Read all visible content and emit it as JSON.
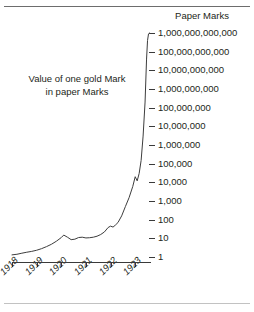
{
  "figure": {
    "background_color": "#ffffff",
    "line_color": "#3d3d3d",
    "text_color": "#231f20"
  },
  "rules": {
    "top_rule": "",
    "bottom_rule": ""
  },
  "axis_header": "Paper Marks",
  "annotation": {
    "line1": "Value of one gold Mark",
    "line2": "in paper Marks"
  },
  "y_axis": {
    "scale": "log10",
    "tick_labels": [
      "1,000,000,000,000",
      "100,000,000,000",
      "10,000,000,000",
      "1,000,000,000",
      "100,000,000",
      "10,000,000",
      "1,000,000",
      "100,000",
      "10,000",
      "1,000",
      "100",
      "10",
      "1"
    ]
  },
  "x_axis": {
    "tick_labels": [
      "1918",
      "1919",
      "1920",
      "1921",
      "1922",
      "1923"
    ]
  },
  "chart_data": {
    "type": "line",
    "title": "Value of one gold Mark in paper Marks",
    "subtitle": "",
    "xlabel": "",
    "ylabel": "Paper Marks",
    "yscale": "log",
    "ylim": [
      1,
      1000000000000
    ],
    "xlim": [
      1918.0,
      1923.6
    ],
    "grid": false,
    "legend": false,
    "y_tick_values": [
      1,
      10,
      100,
      1000,
      10000,
      100000,
      1000000,
      10000000,
      100000000,
      1000000000,
      10000000000,
      100000000000,
      1000000000000
    ],
    "y_tick_labels": [
      "1",
      "10",
      "100",
      "1,000",
      "10,000",
      "100,000",
      "1,000,000",
      "10,000,000",
      "100,000,000",
      "1,000,000,000",
      "10,000,000,000",
      "100,000,000,000",
      "1,000,000,000,000"
    ],
    "x_tick_values": [
      1918,
      1919,
      1920,
      1921,
      1922,
      1923
    ],
    "x_tick_labels": [
      "1918",
      "1919",
      "1920",
      "1921",
      "1922",
      "1923"
    ],
    "series": [
      {
        "name": "Value of one gold Mark in paper Marks",
        "x": [
          1918.0,
          1918.2,
          1918.4,
          1918.6,
          1918.8,
          1919.0,
          1919.2,
          1919.4,
          1919.6,
          1919.8,
          1920.0,
          1920.1,
          1920.25,
          1920.4,
          1920.55,
          1920.7,
          1920.85,
          1921.0,
          1921.15,
          1921.3,
          1921.45,
          1921.6,
          1921.75,
          1921.9,
          1922.0,
          1922.1,
          1922.2,
          1922.3,
          1922.45,
          1922.6,
          1922.75,
          1922.9,
          1923.0,
          1923.08,
          1923.16,
          1923.24,
          1923.32,
          1923.4,
          1923.46,
          1923.5,
          1923.54,
          1923.58
        ],
        "y": [
          1.3,
          1.4,
          1.6,
          1.8,
          2.0,
          2.3,
          2.8,
          3.6,
          4.8,
          7.0,
          11.0,
          15.0,
          11.5,
          8.5,
          9.0,
          11.0,
          11.5,
          10.5,
          10.8,
          11.5,
          13.0,
          16.0,
          22.0,
          38.0,
          45.0,
          40.0,
          52.0,
          70.0,
          160.0,
          500.0,
          1500.0,
          6000.0,
          20000.0,
          12000.0,
          30000.0,
          150000.0,
          3000000.0,
          200000000.0,
          40000000000.0,
          400000000000.0,
          900000000000.0,
          1000000000000.0
        ]
      }
    ],
    "annotations": [
      {
        "text": "Value of one gold Mark in paper Marks",
        "x": 1919.0,
        "y": 300000000.0
      },
      {
        "text": "Paper Marks",
        "x": 1923.6,
        "y": 5000000000000.0
      }
    ]
  }
}
